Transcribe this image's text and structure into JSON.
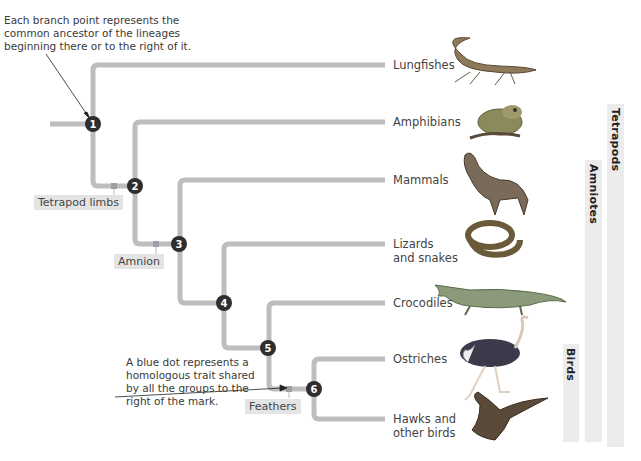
{
  "notes": {
    "branch_point": [
      "Each branch point represents the",
      "common ancestor of the lineages",
      "beginning there or to the right of it."
    ],
    "blue_dot": [
      "A blue dot represents a",
      "homologous trait shared",
      "by all the groups to the",
      "right of the mark."
    ]
  },
  "nodes": [
    "1",
    "2",
    "3",
    "4",
    "5",
    "6"
  ],
  "taxa": [
    {
      "label": [
        "Lungfishes"
      ],
      "icon": "lungfish-illustration"
    },
    {
      "label": [
        "Amphibians"
      ],
      "icon": "frog-illustration"
    },
    {
      "label": [
        "Mammals"
      ],
      "icon": "wolf-illustration"
    },
    {
      "label": [
        "Lizards",
        "and snakes"
      ],
      "icon": "snake-illustration"
    },
    {
      "label": [
        "Crocodiles"
      ],
      "icon": "crocodile-illustration"
    },
    {
      "label": [
        "Ostriches"
      ],
      "icon": "ostrich-illustration"
    },
    {
      "label": [
        "Hawks and",
        "other birds"
      ],
      "icon": "hawk-illustration"
    }
  ],
  "traits": [
    "Tetrapod limbs",
    "Amnion",
    "Feathers"
  ],
  "clades": [
    "Tetrapods",
    "Amniotes",
    "Birds"
  ],
  "colors": {
    "branch": "#bdbdbd",
    "node": "#2e2e2e",
    "trait_bg": "#e4e4e4",
    "clade_bg": "#ececec"
  }
}
